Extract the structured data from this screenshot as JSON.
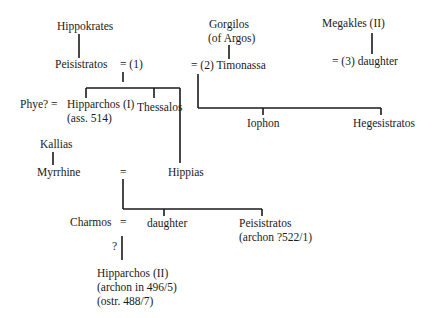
{
  "diagram": {
    "type": "family-tree",
    "people": {
      "hippokrates": "Hippokrates",
      "peisistratos": "Peisistratos",
      "marriage1": "= (1)",
      "gorgilos": "Gorgilos",
      "gorgilos_note": "(of Argos)",
      "marriage2_timonassa": "= (2) Timonassa",
      "megakles": "Megakles (II)",
      "marriage3_daughter": "= (3)  daughter",
      "phye": "Phye? =",
      "hipparchos1": "Hipparchos (I)",
      "hipparchos1_note": "(ass. 514)",
      "thessalos": "Thessalos",
      "iophon": "Iophon",
      "hegesistratos": "Hegesistratos",
      "kallias": "Kallias",
      "myrrhine": "Myrrhine",
      "myrrhine_eq": "=",
      "hippias": "Hippias",
      "charmos": "Charmos",
      "charmos_eq": "=",
      "daughter": "daughter",
      "peisistratos2": "Peisistratos",
      "peisistratos2_note": "(archon ?522/1)",
      "uncertain_mark": "?",
      "hipparchos2": "Hipparchos (II)",
      "hipparchos2_note1": "(archon in 496/5)",
      "hipparchos2_note2": "(ostr. 488/7)"
    },
    "relations": [
      {
        "type": "parent",
        "from": "Hippokrates",
        "to": "Peisistratos"
      },
      {
        "type": "marriage",
        "label": "(1)",
        "a": "Peisistratos",
        "children": [
          "Hipparchos (I)",
          "Thessalos",
          "Hippias"
        ]
      },
      {
        "type": "parent",
        "from": "Gorgilos (of Argos)",
        "to": "Timonassa"
      },
      {
        "type": "marriage",
        "label": "(2)",
        "a": "Peisistratos",
        "b": "Timonassa",
        "children": [
          "Iophon",
          "Hegesistratos"
        ]
      },
      {
        "type": "parent",
        "from": "Megakles (II)",
        "to": "daughter"
      },
      {
        "type": "marriage",
        "label": "(3)",
        "a": "Peisistratos",
        "b": "daughter of Megakles (II)"
      },
      {
        "type": "marriage",
        "a": "Phye?",
        "b": "Hipparchos (I)"
      },
      {
        "type": "parent",
        "from": "Kallias",
        "to": "Myrrhine"
      },
      {
        "type": "marriage",
        "a": "Myrrhine",
        "b": "Hippias",
        "children": [
          "daughter",
          "Peisistratos"
        ]
      },
      {
        "type": "marriage",
        "a": "Charmos",
        "b": "daughter",
        "children": [
          "Hipparchos (II)"
        ],
        "uncertain": true
      }
    ]
  }
}
